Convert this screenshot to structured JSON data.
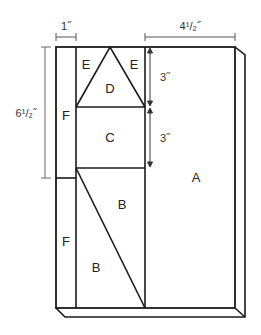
{
  "diagram": {
    "pieces": {
      "A": "A",
      "B_upper": "B",
      "B_lower": "B",
      "C": "C",
      "D": "D",
      "E_left": "E",
      "E_right": "E",
      "F_upper": "F",
      "F_lower": "F"
    },
    "dimensions": {
      "strip_width": "1˝",
      "panel_width": "4¹/₂˝",
      "left_height": "6¹/₂˝",
      "top_section": "3˝",
      "middle_section": "3˝"
    },
    "colors": {
      "stroke": "#1a1a1a",
      "dim_stroke": "#555555",
      "background": "#ffffff"
    }
  }
}
